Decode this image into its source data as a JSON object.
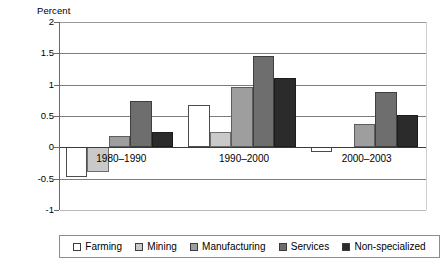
{
  "chart_data": {
    "type": "bar",
    "title": "",
    "subtitle": "",
    "xlabel": "",
    "ylabel": "Percent",
    "ylim": [
      -1,
      2
    ],
    "yticks": [
      2,
      1.5,
      1,
      0.5,
      0,
      -0.5,
      -1
    ],
    "ytick_labels": [
      "2",
      "1.5",
      "1",
      "0.5",
      "0",
      "-0.5",
      "-1"
    ],
    "grid": true,
    "legend_position": "bottom",
    "categories": [
      "1980–1990",
      "1990–2000",
      "2000–2003"
    ],
    "series": [
      {
        "name": "Farming",
        "color": "#ffffff",
        "values": [
          -0.47,
          0.68,
          -0.08
        ]
      },
      {
        "name": "Mining",
        "color": "#c9c9c9",
        "values": [
          -0.4,
          0.25,
          0.0
        ]
      },
      {
        "name": "Manufacturing",
        "color": "#9e9e9e",
        "values": [
          0.18,
          0.97,
          0.38
        ]
      },
      {
        "name": "Services",
        "color": "#6e6e6e",
        "values": [
          0.74,
          1.46,
          0.88
        ]
      },
      {
        "name": "Non-specialized",
        "color": "#2b2b2b",
        "values": [
          0.25,
          1.1,
          0.52
        ]
      }
    ]
  },
  "legend": {
    "items": [
      {
        "label": "Farming"
      },
      {
        "label": "Mining"
      },
      {
        "label": "Manufacturing"
      },
      {
        "label": "Services"
      },
      {
        "label": "Non-specialized"
      }
    ]
  }
}
